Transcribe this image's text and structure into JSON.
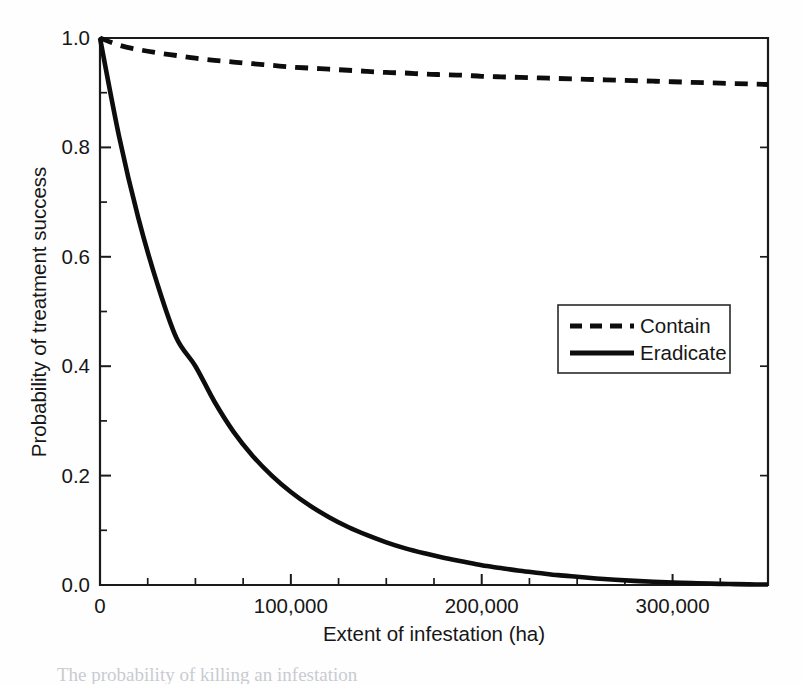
{
  "figure": {
    "caption_fragment": "The probability of killing an infestation"
  },
  "chart_data": {
    "type": "line",
    "title": "",
    "subtitle": "",
    "xlabel": "Extent of infestation (ha)",
    "ylabel": "Probability of treatment success",
    "xlim": [
      0,
      350000
    ],
    "ylim": [
      0.0,
      1.0
    ],
    "grid": false,
    "legend_position": "center-right",
    "x_ticks_major": [
      0,
      100000,
      200000,
      300000
    ],
    "x_tick_labels": [
      "0",
      "100,000",
      "200,000",
      "300,000"
    ],
    "x_tick_minor_step": 25000,
    "y_ticks_major": [
      0.0,
      0.2,
      0.4,
      0.6,
      0.8,
      1.0
    ],
    "y_tick_labels": [
      "0.0",
      "0.2",
      "0.4",
      "0.6",
      "0.8",
      "1.0"
    ],
    "y_tick_minor_step": 0.1,
    "x": [
      0,
      10000,
      20000,
      30000,
      40000,
      50000,
      60000,
      70000,
      80000,
      90000,
      100000,
      110000,
      120000,
      130000,
      140000,
      150000,
      160000,
      170000,
      180000,
      190000,
      200000,
      210000,
      220000,
      230000,
      240000,
      250000,
      260000,
      270000,
      280000,
      290000,
      300000,
      310000,
      320000,
      330000,
      340000,
      350000
    ],
    "series": [
      {
        "name": "Contain",
        "style": "dashed",
        "color": "#0d0d0d",
        "values": [
          1.0,
          0.987,
          0.979,
          0.973,
          0.968,
          0.963,
          0.959,
          0.956,
          0.953,
          0.95,
          0.947,
          0.945,
          0.943,
          0.941,
          0.939,
          0.937,
          0.936,
          0.934,
          0.933,
          0.932,
          0.93,
          0.929,
          0.928,
          0.927,
          0.926,
          0.925,
          0.924,
          0.923,
          0.922,
          0.921,
          0.92,
          0.919,
          0.918,
          0.917,
          0.916,
          0.915
        ]
      },
      {
        "name": "Eradicate",
        "style": "solid",
        "color": "#0d0d0d",
        "values": [
          1.0,
          0.82,
          0.672,
          0.551,
          0.452,
          0.4,
          0.335,
          0.28,
          0.236,
          0.2,
          0.17,
          0.145,
          0.124,
          0.106,
          0.091,
          0.078,
          0.067,
          0.058,
          0.05,
          0.043,
          0.036,
          0.031,
          0.026,
          0.022,
          0.018,
          0.015,
          0.012,
          0.0095,
          0.0075,
          0.006,
          0.0045,
          0.0035,
          0.0025,
          0.0018,
          0.0012,
          0.0008
        ]
      }
    ],
    "legend": [
      {
        "label": "Contain",
        "style": "dashed"
      },
      {
        "label": "Eradicate",
        "style": "solid"
      }
    ]
  }
}
